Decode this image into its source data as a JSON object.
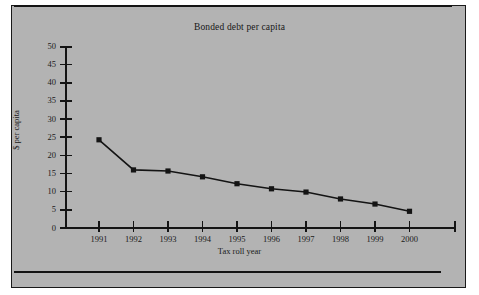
{
  "document": {
    "background_color": "#b3b3b3",
    "ink_color": "#141414"
  },
  "chart_data": {
    "type": "line",
    "title": "Bonded debt per capita",
    "xlabel": "Tax roll year",
    "ylabel": "$ per capita",
    "categories": [
      "1991",
      "1992",
      "1993",
      "1994",
      "1995",
      "1996",
      "1997",
      "1998",
      "1999",
      "2000"
    ],
    "values": [
      24.3,
      16.0,
      15.7,
      14.1,
      12.2,
      10.8,
      9.9,
      8.0,
      6.6,
      4.6
    ],
    "series": [
      {
        "name": "Bonded debt per capita",
        "values": [
          24.3,
          16.0,
          15.7,
          14.1,
          12.2,
          10.8,
          9.9,
          8.0,
          6.6,
          4.6
        ]
      }
    ],
    "ylim": [
      0,
      50
    ],
    "yticks": [
      0,
      5,
      10,
      15,
      20,
      25,
      30,
      35,
      40,
      45,
      50
    ],
    "ytick_labels": [
      "0",
      "5",
      "10",
      "15",
      "20",
      "25",
      "30",
      "35",
      "40",
      "45",
      "50"
    ],
    "grid": false,
    "legend": false,
    "marker": "square",
    "line_color": "#141414",
    "marker_color": "#141414"
  }
}
